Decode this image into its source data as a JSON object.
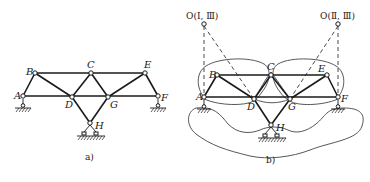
{
  "figure_a": {
    "caption": "a)",
    "nodes": {
      "A": {
        "label": "A",
        "x": 23,
        "y": 96
      },
      "B": {
        "label": "B",
        "x": 35,
        "y": 73
      },
      "C": {
        "label": "C",
        "x": 91,
        "y": 73
      },
      "D": {
        "label": "D",
        "x": 72,
        "y": 97
      },
      "E": {
        "label": "E",
        "x": 145,
        "y": 73
      },
      "F": {
        "label": "F",
        "x": 158,
        "y": 96
      },
      "G": {
        "label": "G",
        "x": 108,
        "y": 97
      },
      "H": {
        "label": "H",
        "x": 90,
        "y": 123
      }
    },
    "members": [
      [
        "A",
        "B"
      ],
      [
        "B",
        "C"
      ],
      [
        "C",
        "E"
      ],
      [
        "A",
        "D"
      ],
      [
        "D",
        "G"
      ],
      [
        "G",
        "F"
      ],
      [
        "B",
        "D"
      ],
      [
        "C",
        "D"
      ],
      [
        "C",
        "G"
      ],
      [
        "E",
        "G"
      ],
      [
        "E",
        "F"
      ],
      [
        "D",
        "H"
      ],
      [
        "G",
        "H"
      ]
    ],
    "supports": [
      "A",
      "F",
      "H"
    ]
  },
  "figure_b": {
    "caption": "b)",
    "nodes": {
      "A": {
        "label": "A",
        "x": 204,
        "y": 97
      },
      "B": {
        "label": "B",
        "x": 217,
        "y": 75
      },
      "C": {
        "label": "C",
        "x": 271,
        "y": 75
      },
      "D": {
        "label": "D",
        "x": 254,
        "y": 99
      },
      "E": {
        "label": "E",
        "x": 327,
        "y": 75
      },
      "F": {
        "label": "F",
        "x": 338,
        "y": 97
      },
      "G": {
        "label": "G",
        "x": 290,
        "y": 99
      },
      "H": {
        "label": "H",
        "x": 271,
        "y": 125
      }
    },
    "instant_centers": [
      {
        "label": "O(Ⅰ, Ⅲ)",
        "x": 204,
        "y": 24
      },
      {
        "label": "O(Ⅱ, Ⅲ)",
        "x": 338,
        "y": 24
      }
    ],
    "members": [
      [
        "A",
        "B"
      ],
      [
        "B",
        "C"
      ],
      [
        "C",
        "E"
      ],
      [
        "A",
        "D"
      ],
      [
        "D",
        "G"
      ],
      [
        "G",
        "F"
      ],
      [
        "B",
        "D"
      ],
      [
        "C",
        "D"
      ],
      [
        "C",
        "G"
      ],
      [
        "E",
        "G"
      ],
      [
        "E",
        "F"
      ],
      [
        "D",
        "H"
      ],
      [
        "G",
        "H"
      ]
    ],
    "supports": [
      "A",
      "F",
      "H"
    ],
    "rigid_body_labels": [
      "Ⅰ",
      "Ⅱ",
      "Ⅲ"
    ]
  }
}
